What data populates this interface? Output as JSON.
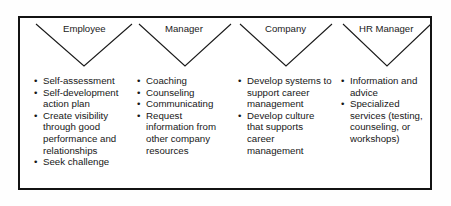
{
  "figure": {
    "kind": "career-management-roles-chart",
    "border_color": "#131313",
    "background_color": "#ffffff",
    "text_color": "#171717",
    "bullet_glyph": "•"
  },
  "columns": [
    {
      "header": "Employee",
      "items": [
        "Self-assessment",
        "Self-development action plan",
        "Create visibility through good performance and relationships",
        "Seek challenge"
      ]
    },
    {
      "header": "Manager",
      "items": [
        "Coaching",
        "Counseling",
        "Communicating",
        "Request information from other company resources"
      ]
    },
    {
      "header": "Company",
      "items": [
        "Develop systems to support career management",
        "Develop culture that supports career management"
      ]
    },
    {
      "header": "HR Manager",
      "items": [
        "Information and advice",
        "Specialized services (testing, counseling, or workshops)"
      ]
    }
  ]
}
